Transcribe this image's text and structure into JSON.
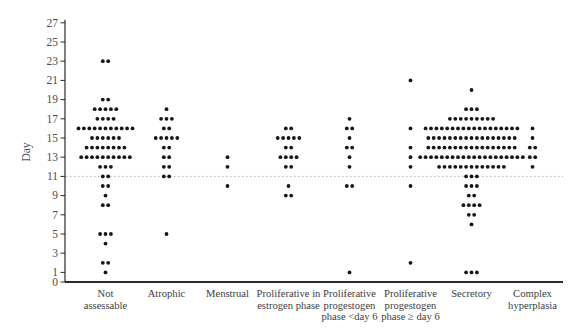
{
  "figure": {
    "background": "#ffffff",
    "dot_color": "#161616",
    "axis_color": "#2b2b2b",
    "tick_label_color": "#4d4d4d",
    "category_label_color": "#3d3d3d",
    "reference_line_color": "#b5b5b5"
  },
  "chart_data": {
    "type": "scatter",
    "subtype": "dot-strip-plot",
    "title": "",
    "xlabel": "",
    "ylabel": "Day",
    "ylim": [
      0,
      27
    ],
    "yticks": [
      0,
      1,
      3,
      5,
      7,
      9,
      11,
      13,
      15,
      17,
      19,
      21,
      23,
      25,
      27
    ],
    "grid": false,
    "legend": false,
    "reference_line_day": 11,
    "categories": [
      "Not assessable",
      "Atrophic",
      "Menstrual",
      "Proliferative in estrogen phase",
      "Proliferative progestogen phase <day 6",
      "Proliferative progestogen phase ≥ day 6",
      "Secretory",
      "Complex hyperplasia"
    ],
    "category_label_lines": [
      [
        "Not",
        "assessable"
      ],
      [
        "Atrophic"
      ],
      [
        "Menstrual"
      ],
      [
        "Proliferative in",
        "estrogen phase"
      ],
      [
        "Proliferative",
        "progestogen",
        "phase <day 6"
      ],
      [
        "Proliferative",
        "progestogen",
        "phase ≥ day 6"
      ],
      [
        "Secretory"
      ],
      [
        "Complex",
        "hyperplasia"
      ]
    ],
    "series": [
      {
        "name": "Not assessable",
        "points": [
          {
            "day": 23,
            "count": 2
          },
          {
            "day": 19,
            "count": 2
          },
          {
            "day": 18,
            "count": 5
          },
          {
            "day": 17,
            "count": 4
          },
          {
            "day": 16,
            "count": 11
          },
          {
            "day": 15,
            "count": 6
          },
          {
            "day": 14,
            "count": 8
          },
          {
            "day": 13,
            "count": 10
          },
          {
            "day": 12,
            "count": 3
          },
          {
            "day": 11,
            "count": 2
          },
          {
            "day": 10,
            "count": 2
          },
          {
            "day": 9,
            "count": 1
          },
          {
            "day": 8,
            "count": 2
          },
          {
            "day": 5,
            "count": 3
          },
          {
            "day": 4,
            "count": 1
          },
          {
            "day": 2,
            "count": 2
          },
          {
            "day": 1,
            "count": 1
          }
        ]
      },
      {
        "name": "Atrophic",
        "points": [
          {
            "day": 18,
            "count": 1
          },
          {
            "day": 17,
            "count": 3
          },
          {
            "day": 16,
            "count": 2
          },
          {
            "day": 15,
            "count": 5
          },
          {
            "day": 14,
            "count": 2
          },
          {
            "day": 13,
            "count": 2
          },
          {
            "day": 12,
            "count": 2
          },
          {
            "day": 11,
            "count": 2
          },
          {
            "day": 5,
            "count": 1
          }
        ]
      },
      {
        "name": "Menstrual",
        "points": [
          {
            "day": 13,
            "count": 1
          },
          {
            "day": 12,
            "count": 1
          },
          {
            "day": 10,
            "count": 1
          }
        ]
      },
      {
        "name": "Proliferative in estrogen phase",
        "points": [
          {
            "day": 16,
            "count": 2
          },
          {
            "day": 15,
            "count": 5
          },
          {
            "day": 14,
            "count": 2
          },
          {
            "day": 13,
            "count": 4
          },
          {
            "day": 12,
            "count": 2
          },
          {
            "day": 10,
            "count": 1
          },
          {
            "day": 9,
            "count": 2
          }
        ]
      },
      {
        "name": "Proliferative progestogen phase <day 6",
        "points": [
          {
            "day": 17,
            "count": 1
          },
          {
            "day": 16,
            "count": 2
          },
          {
            "day": 15,
            "count": 1
          },
          {
            "day": 14,
            "count": 2
          },
          {
            "day": 13,
            "count": 1
          },
          {
            "day": 12,
            "count": 1
          },
          {
            "day": 10,
            "count": 2
          },
          {
            "day": 1,
            "count": 1
          }
        ]
      },
      {
        "name": "Proliferative progestogen phase ≥ day 6",
        "points": [
          {
            "day": 21,
            "count": 1
          },
          {
            "day": 16,
            "count": 1
          },
          {
            "day": 14,
            "count": 1
          },
          {
            "day": 13,
            "count": 1
          },
          {
            "day": 12,
            "count": 1
          },
          {
            "day": 10,
            "count": 1
          },
          {
            "day": 2,
            "count": 1
          }
        ]
      },
      {
        "name": "Secretory",
        "points": [
          {
            "day": 20,
            "count": 1
          },
          {
            "day": 18,
            "count": 3
          },
          {
            "day": 17,
            "count": 9
          },
          {
            "day": 16,
            "count": 18
          },
          {
            "day": 15,
            "count": 17
          },
          {
            "day": 14,
            "count": 17
          },
          {
            "day": 13,
            "count": 20
          },
          {
            "day": 12,
            "count": 13
          },
          {
            "day": 11,
            "count": 3
          },
          {
            "day": 10,
            "count": 3
          },
          {
            "day": 9,
            "count": 2
          },
          {
            "day": 8,
            "count": 4
          },
          {
            "day": 7,
            "count": 2
          },
          {
            "day": 6,
            "count": 1
          },
          {
            "day": 1,
            "count": 3
          }
        ]
      },
      {
        "name": "Complex hyperplasia",
        "points": [
          {
            "day": 16,
            "count": 1
          },
          {
            "day": 15,
            "count": 1
          },
          {
            "day": 14,
            "count": 2
          },
          {
            "day": 13,
            "count": 2
          },
          {
            "day": 12,
            "count": 1
          }
        ]
      }
    ]
  }
}
